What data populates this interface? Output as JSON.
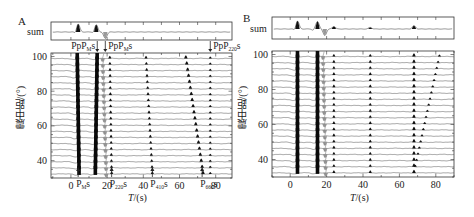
{
  "chart_data": [
    {
      "type": "line",
      "panel": "A",
      "title": "A",
      "sum_label": "sum",
      "xlabel": "T/(s)",
      "ylabel": "震中距/(°)",
      "xlim": [
        -11,
        89
      ],
      "ylim": [
        30,
        102
      ],
      "xticks": [
        0,
        20,
        40,
        60,
        80
      ],
      "yticks": [
        40,
        60,
        80,
        100
      ],
      "grid": false,
      "distances": [
        100,
        96.5,
        93,
        89.5,
        86,
        82.5,
        79,
        75.5,
        72,
        68.5,
        65,
        61.5,
        58,
        54.5,
        51,
        47.5,
        44,
        40.5,
        37,
        33.5
      ],
      "phases": [
        {
          "name": "Ps (direct)",
          "t_top": 3.5,
          "t_bottom": 4.5,
          "style": "black-strong"
        },
        {
          "name": "PpPms",
          "t_top": 14.5,
          "t_bottom": 13.5,
          "style": "black-strong"
        },
        {
          "name": "PpPms (negative)",
          "t_top": 17.5,
          "t_bottom": 19.5,
          "style": "gray-neg"
        },
        {
          "name": "P220s",
          "t_top": 21.5,
          "t_bottom": 22.5,
          "style": "small"
        },
        {
          "name": "P410s",
          "t_top": 41.5,
          "t_bottom": 45,
          "style": "small"
        },
        {
          "name": "P660s",
          "t_top": 63.5,
          "t_bottom": 73,
          "style": "medium"
        },
        {
          "name": "PpP220s",
          "t_top": 77,
          "t_bottom": 77,
          "style": "tiny"
        }
      ],
      "sum_peaks": [
        {
          "t": 4,
          "amp": 1.0,
          "sign": 1
        },
        {
          "t": 14,
          "amp": 0.9,
          "sign": 1
        },
        {
          "t": 19,
          "amp": 0.8,
          "sign": -1
        }
      ],
      "annotations_top": [
        {
          "text": "PpP",
          "sub": "M",
          "suffix": "s",
          "arrow": "right",
          "t": 14
        },
        {
          "text": "PpP",
          "sub": "M",
          "suffix": "s",
          "arrow": "left",
          "t": 19
        },
        {
          "text": "PpP",
          "sub": "220",
          "suffix": "s",
          "arrow": "left",
          "t": 77
        }
      ],
      "annotations_bottom": [
        {
          "text": "P",
          "sub": "M",
          "suffix": "s",
          "t": 4
        },
        {
          "text": "P",
          "sub": "220",
          "suffix": "s",
          "t": 22.5
        },
        {
          "text": "P",
          "sub": "410",
          "suffix": "s",
          "t": 45
        },
        {
          "text": "P",
          "sub": "660",
          "suffix": "s",
          "t": 72.5
        }
      ]
    },
    {
      "type": "line",
      "panel": "B",
      "title": "B",
      "sum_label": "sum",
      "xlabel": "T/(s)",
      "ylabel": "震中距/(°)",
      "xlim": [
        -10,
        90
      ],
      "ylim": [
        30,
        102
      ],
      "xticks": [
        0,
        20,
        40,
        60,
        80
      ],
      "yticks": [
        40,
        60,
        80,
        100
      ],
      "grid": false,
      "distances": [
        100,
        96.5,
        93,
        89.5,
        86,
        82.5,
        79,
        75.5,
        72,
        68.5,
        65,
        61.5,
        58,
        54.5,
        51,
        47.5,
        44,
        40.5,
        37,
        33.5
      ],
      "phases": [
        {
          "name": "Ps (direct)",
          "t_top": 4,
          "t_bottom": 4,
          "style": "black-strong"
        },
        {
          "name": "PpPms",
          "t_top": 15,
          "t_bottom": 15,
          "style": "black-strong"
        },
        {
          "name": "PpPms (negative)",
          "t_top": 18,
          "t_bottom": 19.5,
          "style": "gray-neg"
        },
        {
          "name": "P220s",
          "t_top": 24,
          "t_bottom": 24,
          "style": "small"
        },
        {
          "name": "P410s",
          "t_top": 44,
          "t_bottom": 44,
          "style": "small"
        },
        {
          "name": "P660s",
          "t_top": 68,
          "t_bottom": 68,
          "style": "medium"
        },
        {
          "name": "PpP220s (moveout)",
          "t_top": 82,
          "t_bottom": 68,
          "style": "tiny"
        }
      ],
      "sum_peaks": [
        {
          "t": 4,
          "amp": 1.0,
          "sign": 1
        },
        {
          "t": 15,
          "amp": 0.95,
          "sign": 1
        },
        {
          "t": 19,
          "amp": 0.8,
          "sign": -1
        },
        {
          "t": 24,
          "amp": 0.3,
          "sign": 1
        },
        {
          "t": 44,
          "amp": 0.2,
          "sign": 1
        },
        {
          "t": 68,
          "amp": 0.4,
          "sign": 1
        }
      ],
      "annotations_top": [],
      "annotations_bottom": []
    }
  ],
  "layout": {
    "panels": [
      {
        "id": "A",
        "sum_box": [
          51,
          22,
          232,
          40
        ],
        "main_box": [
          51,
          53,
          232,
          178
        ]
      },
      {
        "id": "B",
        "sum_box": [
          272,
          17,
          454,
          39
        ],
        "main_box": [
          272,
          51,
          454,
          177
        ]
      }
    ]
  },
  "labels": {
    "A": {
      "letter": "A",
      "sum": "sum",
      "ylabel": "震中距/(°)",
      "xlabel_italic": "T",
      "xlabel_rest": "/(s)"
    },
    "B": {
      "letter": "B",
      "sum": "sum",
      "ylabel": "震中距/(°)",
      "xlabel_italic": "T",
      "xlabel_rest": "/(s)"
    }
  }
}
